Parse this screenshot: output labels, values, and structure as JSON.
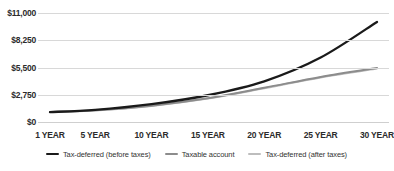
{
  "chart_data": {
    "type": "line",
    "title": "",
    "xlabel": "",
    "ylabel": "",
    "ylim": [
      0,
      11000
    ],
    "xlim": [
      1,
      30
    ],
    "grid": true,
    "legend_position": "bottom",
    "y_ticks": [
      0,
      2750,
      5500,
      8250,
      11000
    ],
    "y_tick_labels": [
      "$0",
      "$2,750",
      "$5,500",
      "$8,250",
      "$11,000"
    ],
    "x_tick_values": [
      1,
      5,
      10,
      15,
      20,
      25,
      30
    ],
    "x_tick_labels": [
      "1 YEAR",
      "5 YEAR",
      "10 YEAR",
      "15 YEAR",
      "20 YEAR",
      "25 YEAR",
      "30 YEAR"
    ],
    "x": [
      1,
      5,
      10,
      15,
      20,
      25,
      30
    ],
    "series": [
      {
        "name": "Tax-deferred (before taxes)",
        "color": "#1a1a1a",
        "values": [
          1000,
          1220,
          1800,
          2700,
          4100,
          6500,
          10100
        ]
      },
      {
        "name": "Taxable account",
        "color": "#8c8c8c",
        "values": [
          1000,
          1180,
          1650,
          2400,
          3450,
          4550,
          5450
        ]
      },
      {
        "name": "Tax-deferred (after taxes)",
        "color": "#bdbdbd",
        "values": [
          1000,
          1165,
          1620,
          2360,
          3400,
          4500,
          5400
        ]
      }
    ]
  },
  "legend": {
    "items": [
      {
        "label": "Tax-deferred (before taxes)",
        "color": "#1a1a1a"
      },
      {
        "label": "Taxable account",
        "color": "#8c8c8c"
      },
      {
        "label": "Tax-deferred (after taxes)",
        "color": "#bdbdbd"
      }
    ]
  }
}
